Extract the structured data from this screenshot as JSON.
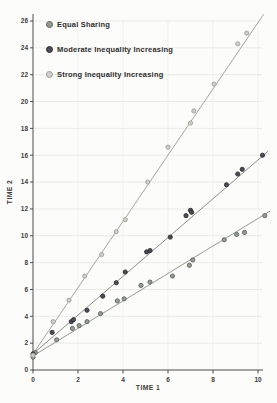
{
  "chart_data": {
    "type": "scatter",
    "title": "",
    "xlabel": "TIME 1",
    "ylabel": "TIME 2",
    "xlim": [
      0,
      10
    ],
    "ylim": [
      0,
      26
    ],
    "xticks": [
      0,
      2,
      4,
      6,
      8,
      10
    ],
    "yticks": [
      0,
      2,
      4,
      6,
      8,
      10,
      12,
      14,
      16,
      18,
      20,
      22,
      24,
      26
    ],
    "grid": true,
    "legend_position": "top-left",
    "series": [
      {
        "name": "Equal Sharing",
        "marker_color": "#949b91",
        "marker_edge": "#5f665c",
        "line_color": "#9a9a94",
        "fit_line": {
          "x1": 0,
          "y1": 1.05,
          "x2": 10.55,
          "y2": 11.85
        },
        "points": [
          [
            0,
            0.95
          ],
          [
            0.1,
            1.3
          ],
          [
            1.05,
            2.25
          ],
          [
            1.75,
            3.1
          ],
          [
            2.05,
            3.3
          ],
          [
            2.4,
            3.6
          ],
          [
            3.0,
            4.2
          ],
          [
            3.75,
            5.15
          ],
          [
            4.05,
            5.3
          ],
          [
            4.8,
            6.3
          ],
          [
            5.2,
            6.55
          ],
          [
            6.2,
            7.0
          ],
          [
            6.95,
            7.8
          ],
          [
            7.1,
            8.2
          ],
          [
            8.5,
            9.7
          ],
          [
            9.05,
            10.1
          ],
          [
            9.4,
            10.25
          ],
          [
            10.3,
            11.5
          ]
        ]
      },
      {
        "name": "Moderate Inequality Increasing",
        "marker_color": "#4f4b54",
        "marker_edge": "#2f2c33",
        "line_color": "#8e8e8a",
        "fit_line": {
          "x1": 0,
          "y1": 1.2,
          "x2": 10.45,
          "y2": 16.3
        },
        "points": [
          [
            0,
            1.2
          ],
          [
            0.85,
            2.8
          ],
          [
            1.7,
            3.6
          ],
          [
            1.8,
            3.75
          ],
          [
            2.4,
            4.45
          ],
          [
            3.1,
            5.5
          ],
          [
            3.7,
            6.5
          ],
          [
            4.1,
            7.3
          ],
          [
            5.05,
            8.8
          ],
          [
            5.2,
            8.9
          ],
          [
            6.1,
            9.9
          ],
          [
            6.8,
            11.5
          ],
          [
            7.0,
            11.9
          ],
          [
            7.05,
            11.75
          ],
          [
            8.6,
            13.8
          ],
          [
            9.1,
            14.6
          ],
          [
            9.3,
            14.95
          ],
          [
            10.2,
            16.0
          ]
        ]
      },
      {
        "name": "Strong Inequality Increasing",
        "marker_color": "#cdd0c8",
        "marker_edge": "#9da199",
        "line_color": "#a6a6a2",
        "fit_line": {
          "x1": 0,
          "y1": 1.2,
          "x2": 10.25,
          "y2": 26.5
        },
        "points": [
          [
            0,
            1.1
          ],
          [
            0.9,
            3.6
          ],
          [
            1.6,
            5.2
          ],
          [
            2.3,
            7.0
          ],
          [
            3.05,
            8.6
          ],
          [
            3.7,
            10.3
          ],
          [
            4.1,
            11.2
          ],
          [
            5.1,
            14.0
          ],
          [
            6.0,
            16.6
          ],
          [
            7.0,
            18.4
          ],
          [
            7.15,
            19.3
          ],
          [
            8.05,
            21.3
          ],
          [
            9.1,
            24.3
          ],
          [
            9.5,
            25.1
          ]
        ]
      }
    ],
    "colors": {
      "axis": "#4d4d4d",
      "tick_text": "#3c3c3c",
      "grid_h": "#eaeae6",
      "grid_v": "#f1f1ee",
      "background": "#fcfcfa"
    }
  }
}
